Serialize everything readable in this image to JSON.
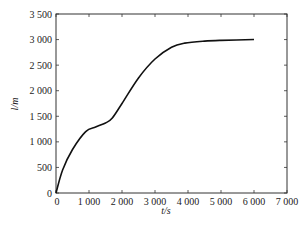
{
  "chart_data": {
    "type": "line",
    "title": "",
    "xlabel": "t/s",
    "ylabel": "l/m",
    "xlim": [
      0,
      7000
    ],
    "ylim": [
      0,
      3500
    ],
    "x_ticks": [
      0,
      1000,
      2000,
      3000,
      4000,
      5000,
      6000,
      7000
    ],
    "x_tick_labels": [
      "0",
      "1 000",
      "2 000",
      "3 000",
      "4 000",
      "5 000",
      "6 000",
      "7 000"
    ],
    "y_ticks": [
      0,
      500,
      1000,
      1500,
      2000,
      2500,
      3000,
      3500
    ],
    "y_tick_labels": [
      "0",
      "500",
      "1 000",
      "1 500",
      "2 000",
      "2 500",
      "3 000",
      "3 500"
    ],
    "grid": false,
    "legend": null,
    "series": [
      {
        "name": "l",
        "color": "#111111",
        "x": [
          0,
          200,
          500,
          900,
          1200,
          1500,
          1700,
          2000,
          2500,
          3000,
          3500,
          3900,
          4500,
          5000,
          6000
        ],
        "values": [
          0,
          450,
          850,
          1200,
          1290,
          1370,
          1460,
          1750,
          2250,
          2620,
          2850,
          2930,
          2970,
          2985,
          3000
        ]
      }
    ]
  },
  "labels": {
    "xlabel": "t/s",
    "ylabel": "l/m"
  }
}
